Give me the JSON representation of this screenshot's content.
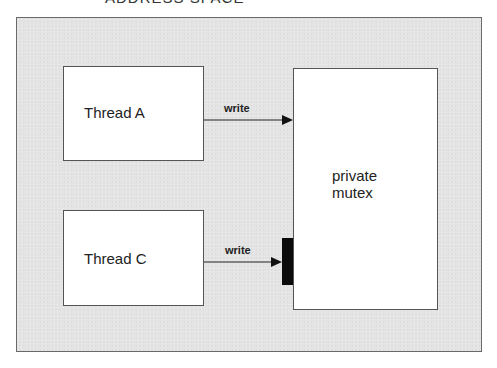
{
  "diagram": {
    "caption": "ADDRESS SPACE",
    "container": {
      "name": "address-space"
    },
    "nodes": [
      {
        "id": "thread-a",
        "label": "Thread A"
      },
      {
        "id": "thread-c",
        "label": "Thread C"
      },
      {
        "id": "mutex",
        "label_line1": "private",
        "label_line2": "mutex"
      }
    ],
    "edges": [
      {
        "from": "thread-a",
        "to": "mutex",
        "label": "write",
        "blocked": false
      },
      {
        "from": "thread-c",
        "to": "mutex",
        "label": "write",
        "blocked": true
      }
    ],
    "colors": {
      "background": "#e4e4e4",
      "box_fill": "#ffffff",
      "border": "#555555",
      "block_bar": "#0a0a0a"
    }
  }
}
